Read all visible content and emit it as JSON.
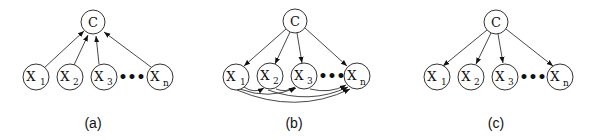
{
  "diagrams": [
    {
      "id": "a",
      "caption": "(a)",
      "root": {
        "label": "C"
      },
      "children": [
        {
          "label": "X",
          "sub": "1"
        },
        {
          "label": "X",
          "sub": "2"
        },
        {
          "label": "X",
          "sub": "3"
        },
        {
          "label": "X",
          "sub": "n"
        }
      ],
      "ellipsis": "•••",
      "edges": "children point to C"
    },
    {
      "id": "b",
      "caption": "(b)",
      "root": {
        "label": "C"
      },
      "children": [
        {
          "label": "X",
          "sub": "1"
        },
        {
          "label": "X",
          "sub": "2"
        },
        {
          "label": "X",
          "sub": "3"
        },
        {
          "label": "X",
          "sub": "n"
        }
      ],
      "ellipsis": "•••",
      "edges": "C points to children; additional curved arcs among X nodes"
    },
    {
      "id": "c",
      "caption": "(c)",
      "root": {
        "label": "C"
      },
      "children": [
        {
          "label": "X",
          "sub": "1"
        },
        {
          "label": "X",
          "sub": "2"
        },
        {
          "label": "X",
          "sub": "3"
        },
        {
          "label": "X",
          "sub": "n"
        }
      ],
      "ellipsis": "•••",
      "edges": "C points to children"
    }
  ]
}
